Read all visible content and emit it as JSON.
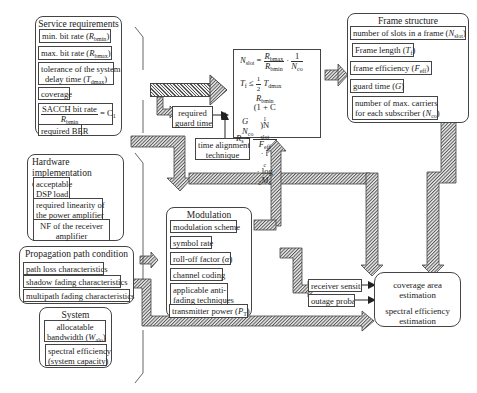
{
  "service_requirements": {
    "title": "Service requirements",
    "items": [
      {
        "text": "min. bit rate (",
        "sym": "R",
        "sub": "bmin",
        "after": ")"
      },
      {
        "text": "max. bit rate (",
        "sym": "R",
        "sub": "bmax",
        "after": ")"
      },
      {
        "line1": "tolerance of the system",
        "line2": "delay time (",
        "sym": "T",
        "sub": "dmax",
        "after": ")"
      },
      {
        "text": "coverage"
      },
      {
        "num": "SACCH bit rate",
        "den_sym": "R",
        "den_sub": "bmin",
        "rhs": "= C",
        "rhs_sub": "1"
      },
      {
        "text": "required BER"
      }
    ]
  },
  "hardware_constraint": {
    "title_line1": "Hardware implementation",
    "title_line2": "constraint",
    "items": [
      {
        "line1": "acceptable",
        "line2": "DSP load"
      },
      {
        "line1": "required linearity of",
        "line2": "the power amplifier"
      },
      {
        "line1": "NF of the receiver",
        "line2": "amplifier"
      }
    ]
  },
  "propagation": {
    "title": "Propagation path condition",
    "items": [
      "path loss characteristics",
      "shadow fading characteristics",
      "multipath fading characteristics"
    ]
  },
  "system_requirements": {
    "title": "System requirements",
    "items": [
      {
        "line1": "allocatable",
        "line2": "bandwidth (",
        "sym": "W",
        "sub": "alo",
        "after": ")"
      },
      {
        "line1": "spectral efficiency",
        "line2": "(system capacity)"
      }
    ]
  },
  "guard_time": {
    "line1": "required",
    "line2": "guard time"
  },
  "time_alignment": {
    "line1": "time alignment",
    "line2": "technique"
  },
  "formulas": {
    "nslot_lhs": "N",
    "nslot_lhs_sub": "slot",
    "eq": "=",
    "nslot_num": "R",
    "nslot_num_sub": "bmax",
    "nslot_den": "R",
    "nslot_den_sub": "bmin",
    "dot": "·",
    "one": "1",
    "nco": "N",
    "nco_sub": "co",
    "tf": "T",
    "tf_sub": "f",
    "le": "≤",
    "half_num": "1",
    "half_den": "2",
    "tdmax": "T",
    "tdmax_sub": "dmax",
    "rs": "R",
    "rs_sub": "s",
    "rs_num_a": "R",
    "rs_num_a_sub": "bmin",
    "rs_num_b": "(1 + C",
    "rs_num_b_sub": "1",
    "rs_num_c": ")N",
    "rs_num_c_sub": "slot",
    "rs_den_a": "F",
    "rs_den_a_sub": "eff",
    "rs_den_b": " · r",
    "rs_den_b_sub": "c",
    "rs_den_c": " · log",
    "rs_den_c_sub": "2",
    "rs_den_d": "M",
    "rs_den_d_sub": "1",
    "g": "G",
    "n": "N",
    "n_sub": "co"
  },
  "frame_structure": {
    "title": "Frame structure",
    "items": [
      {
        "text": "number of slots in a frame (",
        "sym": "N",
        "sub": "slot",
        "after": ")"
      },
      {
        "text": "Frame length (",
        "sym": "T",
        "sub": "f",
        "after": ")"
      },
      {
        "text": "frame efficiency (",
        "sym": "F",
        "sub": "eff",
        "after": ")"
      },
      {
        "text": "guard time (",
        "sym": "G",
        "sub": "",
        "after": ")"
      },
      {
        "line1": "number of max. carriers",
        "line2": "for each subscriber (",
        "sym": "N",
        "sub": "co",
        "after": ")"
      }
    ]
  },
  "modulation": {
    "title": "Modulation parameters",
    "items": [
      {
        "text": "modulation scheme"
      },
      {
        "text": "symbol rate"
      },
      {
        "text": "roll-off factor (",
        "sym": "α",
        "after": ")"
      },
      {
        "text": "channel coding"
      },
      {
        "line1": "applicable anti-",
        "line2": "fading techniques"
      },
      {
        "text": "transmitter power (",
        "sym": "P",
        "sub": "T",
        "after": ")"
      }
    ]
  },
  "receiver_sensitivity": "receiver sensitivity",
  "outage_probability": "outage probability",
  "estimation": {
    "line1": "coverage area",
    "line2": "estimation",
    "line3": "spectral efficiency",
    "line4": "estimation"
  },
  "colors": {
    "stroke": "#444444",
    "hatch_dark": "#555555",
    "hatch_light": "#eeeeee",
    "background": "#ffffff"
  }
}
